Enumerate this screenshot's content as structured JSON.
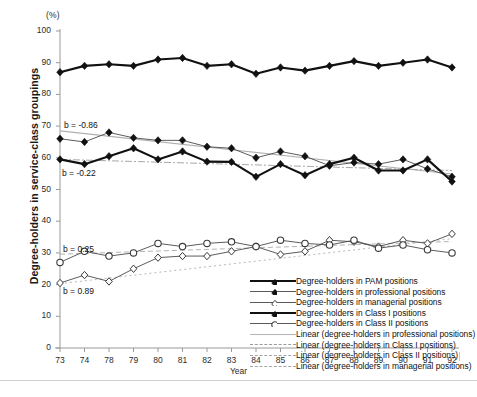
{
  "chart_data": {
    "type": "line",
    "title": "",
    "unit_label": "(%)",
    "xlabel": "Year",
    "ylabel": "Degree-holders in service-class groupings",
    "categories": [
      "73",
      "74",
      "78",
      "79",
      "80",
      "81",
      "82",
      "83",
      "84",
      "85",
      "86",
      "87",
      "88",
      "89",
      "90",
      "91",
      "92"
    ],
    "ylim": [
      0,
      100
    ],
    "yticks": [
      "0",
      "10",
      "20",
      "30",
      "40",
      "50",
      "60",
      "70",
      "80",
      "90",
      "100"
    ],
    "grid": false,
    "legend_position": "inside-lower-right",
    "series": [
      {
        "name": "Degree-holders in PAM positions",
        "style": "thick-solid",
        "marker": "filled-diamond",
        "values": [
          87.0,
          89.0,
          89.5,
          89.0,
          91.0,
          91.5,
          89.0,
          89.5,
          86.5,
          88.5,
          87.5,
          89.0,
          90.5,
          89.0,
          90.0,
          91.0,
          88.5
        ]
      },
      {
        "name": "Degree-holders in professional positions",
        "style": "thin-solid",
        "marker": "filled-diamond",
        "values": [
          66.0,
          65.0,
          68.0,
          66.3,
          65.5,
          65.5,
          63.5,
          63.0,
          60.0,
          62.0,
          60.5,
          57.5,
          58.5,
          58.0,
          59.5,
          56.5,
          54.0
        ]
      },
      {
        "name": "Degree-holders in managerial positions",
        "style": "thin-solid",
        "marker": "open-diamond",
        "values": [
          20.5,
          23.0,
          21.0,
          25.0,
          28.5,
          29.0,
          29.0,
          30.5,
          32.0,
          29.5,
          30.5,
          34.0,
          33.5,
          32.0,
          34.0,
          33.0,
          36.0
        ]
      },
      {
        "name": "Degree-holders in Class I positions",
        "style": "thick-solid",
        "marker": "filled-diamond",
        "values": [
          59.5,
          58.0,
          60.5,
          63.0,
          59.5,
          62.0,
          58.8,
          58.7,
          54.0,
          58.0,
          54.5,
          58.0,
          60.0,
          56.0,
          56.0,
          59.5,
          52.5
        ]
      },
      {
        "name": "Degree-holders in Class II positions",
        "style": "thin-solid",
        "marker": "open-circle",
        "values": [
          27.0,
          30.5,
          29.0,
          30.0,
          33.0,
          32.0,
          33.0,
          33.5,
          32.0,
          34.0,
          33.0,
          32.5,
          34.0,
          31.5,
          32.5,
          31.0,
          30.0
        ]
      }
    ],
    "trendlines": [
      {
        "name": "Linear (degree-holders in professional positions)",
        "style": "solid-grey",
        "slope": -0.86,
        "start_value": 68.5,
        "end_value": 54.9
      },
      {
        "name": "Linear (degree-holders in Class I positions)",
        "style": "dash-dot-grey",
        "slope": -0.22,
        "start_value": 59.5,
        "end_value": 56.0
      },
      {
        "name": "Linear (degree-holders in Class II positions)",
        "style": "dashed-grey",
        "slope": 0.25,
        "start_value": 29.6,
        "end_value": 33.6
      },
      {
        "name": "Linear (degree-holders in managerial positions)",
        "style": "dotted-grey",
        "slope": 0.89,
        "start_value": 20.3,
        "end_value": 34.5
      }
    ],
    "annotations": [
      {
        "text": "b = -0.86",
        "value": -0.86,
        "x_px": 64,
        "y_px": 120
      },
      {
        "text": "b = -0.22",
        "value": -0.22,
        "x_px": 62,
        "y_px": 168
      },
      {
        "text": "b = 0.25",
        "value": 0.25,
        "x_px": 63,
        "y_px": 244
      },
      {
        "text": "b = 0.89",
        "value": 0.89,
        "x_px": 63,
        "y_px": 286
      }
    ],
    "legend_entries": [
      {
        "label": "Degree-holders in PAM positions",
        "key": "thick-solid-filled-diamond"
      },
      {
        "label": "Degree-holders in professional positions",
        "key": "thin-solid-filled-diamond"
      },
      {
        "label": "Degree-holders in managerial positions",
        "key": "thin-solid-open-diamond"
      },
      {
        "label": "Degree-holders in Class I positions",
        "key": "thick-solid-filled-diamond"
      },
      {
        "label": "Degree-holders in Class II positions",
        "key": "thin-solid-open-circle"
      },
      {
        "label": "Linear (degree-holders in professional positions)",
        "key": "solid-grey"
      },
      {
        "label": "Linear (degree-holders in Class I positions)",
        "key": "dash-dot-grey"
      },
      {
        "label": "Linear (degree-holders in Class II positions)",
        "key": "dashed-grey"
      },
      {
        "label": "Linear (degree-holders in managerial positions)",
        "key": "dotted-grey"
      }
    ],
    "colors": {
      "series_line": "#111111",
      "thin_line": "#4a4a4a",
      "trend_line": "#a8a8a8",
      "axis": "#9a9a9a",
      "text": "#1a1a1a"
    }
  }
}
